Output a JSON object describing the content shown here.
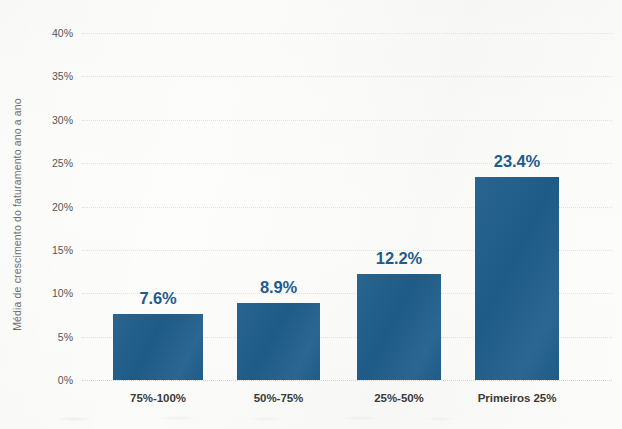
{
  "chart_data": {
    "type": "bar",
    "title": "",
    "xlabel": "",
    "ylabel": "Média de crescimento do faturamento ano a ano",
    "categories": [
      "75%-100%",
      "50%-75%",
      "25%-50%",
      "Primeiros 25%"
    ],
    "values": [
      7.6,
      8.9,
      12.2,
      23.4
    ],
    "value_labels": [
      "7.6%",
      "8.9%",
      "12.2%",
      "23.4%"
    ],
    "ylim": [
      0,
      40
    ],
    "ytick_values": [
      0,
      5,
      10,
      15,
      20,
      25,
      30,
      35,
      40
    ],
    "ytick_labels": [
      "0%",
      "5%",
      "10%",
      "15%",
      "20%",
      "25%",
      "30%",
      "35%",
      "40%"
    ],
    "grid": true,
    "grid_axis": "y",
    "legend": false,
    "legend_position": "none",
    "bar_color": "#205e8c",
    "value_label_color": "#1f5c8b",
    "axis_label_color": "#6f6f6d",
    "tick_label_color": "#565553",
    "category_label_color": "#3b3a38",
    "gridline_color": "#dedddb",
    "background_color": "#fdfdfc"
  }
}
